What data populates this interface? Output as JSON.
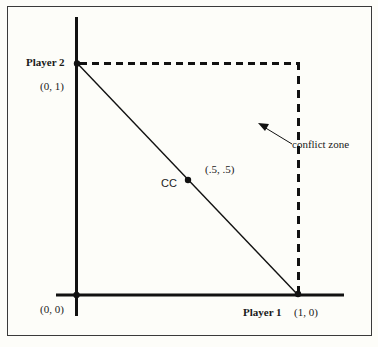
{
  "diagram": {
    "type": "game-theory-payoff-space",
    "axes": {
      "x_label": "Player 1",
      "y_label": "Player 2"
    },
    "points": [
      {
        "id": "origin",
        "label": "(0, 0)"
      },
      {
        "id": "p2-max",
        "label": "(0, 1)"
      },
      {
        "id": "p1-max",
        "label": "(1, 0)"
      },
      {
        "id": "cc",
        "label": "CC",
        "coord_label": "(.5, .5)"
      }
    ],
    "annotation": {
      "text": "conflict zone"
    },
    "colors": {
      "line": "#111111",
      "frame": "#3a3a3a",
      "background": "#fdfdf9"
    }
  }
}
